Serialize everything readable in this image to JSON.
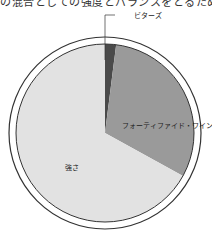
{
  "header": {
    "cutoff_text": "の混合としての強度とバランスをとるための"
  },
  "chart_data": {
    "type": "pie",
    "title": "",
    "start_angle_deg": 0,
    "direction": "clockwise",
    "slices": [
      {
        "label": "ビターズ",
        "value": 2,
        "color": "#4a4a4a"
      },
      {
        "label": "フォーティファイド・ワイン",
        "value": 31,
        "color": "#9a9a9a"
      },
      {
        "label": "強さ",
        "value": 67,
        "color": "#e2e2e2"
      }
    ],
    "labels": {
      "bitters": "ビターズ",
      "fortified": "フォーティファイド・ワイン",
      "strength": "強さ"
    }
  }
}
